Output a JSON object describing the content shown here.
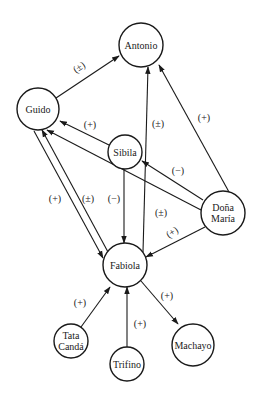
{
  "diagram": {
    "type": "directed-graph",
    "colors": {
      "stroke": "#1a1a1a",
      "background": "#ffffff"
    },
    "nodes": [
      {
        "id": "antonio",
        "label": "Antonio",
        "lines": [
          "Antonio"
        ],
        "x": 141,
        "y": 45,
        "r": 22
      },
      {
        "id": "guido",
        "label": "Guido",
        "lines": [
          "Guido"
        ],
        "x": 38,
        "y": 109,
        "r": 21
      },
      {
        "id": "sibila",
        "label": "Sibila",
        "lines": [
          "Sibila"
        ],
        "x": 125,
        "y": 152,
        "r": 17
      },
      {
        "id": "dona-maria",
        "label": "Doña María",
        "lines": [
          "Doña",
          "María"
        ],
        "x": 223,
        "y": 213,
        "r": 22
      },
      {
        "id": "fabiola",
        "label": "Fabiola",
        "lines": [
          "Fabiola"
        ],
        "x": 125,
        "y": 265,
        "r": 22
      },
      {
        "id": "tata-canda",
        "label": "Tata Candá",
        "lines": [
          "Tata",
          "Candá"
        ],
        "x": 71,
        "y": 341,
        "r": 17
      },
      {
        "id": "trifino",
        "label": "Trifino",
        "lines": [
          "Trifino"
        ],
        "x": 127,
        "y": 364,
        "r": 17
      },
      {
        "id": "machayo",
        "label": "Machayo",
        "lines": [
          "Machayo"
        ],
        "x": 193,
        "y": 345,
        "r": 21
      }
    ],
    "edges": [
      {
        "from": "guido",
        "to": "antonio",
        "sign": "(±)",
        "x1": 56,
        "y1": 98,
        "x2": 119,
        "y2": 56,
        "lx": 79,
        "ly": 67,
        "rot": -33
      },
      {
        "from": "fabiola",
        "to": "antonio",
        "sign": "(±)",
        "x1": 143,
        "y1": 252,
        "x2": 148,
        "y2": 67,
        "lx": 158,
        "ly": 123,
        "rot": 0
      },
      {
        "from": "dona-maria",
        "to": "antonio",
        "sign": "(+)",
        "x1": 229,
        "y1": 192,
        "x2": 159,
        "y2": 65,
        "lx": 204,
        "ly": 117,
        "rot": 0
      },
      {
        "from": "sibila",
        "to": "guido",
        "sign": "(+)",
        "x1": 109,
        "y1": 145,
        "x2": 60,
        "y2": 121,
        "lx": 90,
        "ly": 124,
        "rot": 0
      },
      {
        "from": "dona-maria",
        "to": "sibila",
        "sign": "(−)",
        "x1": 203,
        "y1": 200,
        "x2": 142,
        "y2": 161,
        "lx": 178,
        "ly": 170,
        "rot": 0
      },
      {
        "from": "dona-maria",
        "to": "guido",
        "sign": "(±)",
        "x1": 201,
        "y1": 210,
        "x2": 47,
        "y2": 130,
        "lx": 161,
        "ly": 212,
        "rot": 0
      },
      {
        "from": "dona-maria",
        "to": "fabiola",
        "sign": "(+)",
        "x1": 205,
        "y1": 227,
        "x2": 146,
        "y2": 257,
        "lx": 172,
        "ly": 232,
        "rot": -33
      },
      {
        "from": "guido",
        "to": "fabiola",
        "sign": "(+)",
        "x1": 34,
        "y1": 131,
        "x2": 103,
        "y2": 258,
        "lx": 55,
        "ly": 198,
        "rot": 0
      },
      {
        "from": "fabiola",
        "to": "guido",
        "sign": "(±)",
        "x1": 108,
        "y1": 252,
        "x2": 42,
        "y2": 130,
        "lx": 88,
        "ly": 198,
        "rot": 0
      },
      {
        "from": "sibila",
        "to": "fabiola",
        "sign": "(−)",
        "x1": 124,
        "y1": 169,
        "x2": 124,
        "y2": 243,
        "lx": 114,
        "ly": 198,
        "rot": 0
      },
      {
        "from": "tata-canda",
        "to": "fabiola",
        "sign": "(+)",
        "x1": 81,
        "y1": 327,
        "x2": 110,
        "y2": 287,
        "lx": 80,
        "ly": 302,
        "rot": 0
      },
      {
        "from": "trifino",
        "to": "fabiola",
        "sign": "(+)",
        "x1": 127,
        "y1": 347,
        "x2": 127,
        "y2": 287,
        "lx": 140,
        "ly": 323,
        "rot": 0
      },
      {
        "from": "fabiola",
        "to": "machayo",
        "sign": "(+)",
        "x1": 141,
        "y1": 281,
        "x2": 178,
        "y2": 324,
        "lx": 167,
        "ly": 295,
        "rot": 0
      }
    ]
  }
}
